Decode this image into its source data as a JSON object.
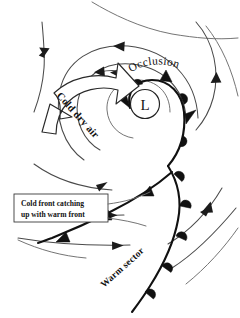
{
  "diagram": {
    "type": "weather-front-diagram",
    "background_color": "#ffffff",
    "ink_color": "#111111",
    "streamline_color": "#4a4a4a"
  },
  "labels": {
    "low_center": "L",
    "occlusion": "Occlusion",
    "cold_dry_air": "Cold dry air",
    "warm_sector": "Warm sector",
    "callout_line1": "Cold front catching",
    "callout_line2": "up with warm front"
  },
  "fronts": [
    {
      "name": "occluded-front",
      "symbol": "alternating-triangle-and-semicircle",
      "color": "#111111"
    },
    {
      "name": "cold-front",
      "symbol": "filled-triangle",
      "color": "#111111"
    },
    {
      "name": "warm-front",
      "symbol": "filled-semicircle",
      "color": "#111111"
    }
  ],
  "icons": {
    "low_pressure": "low-pressure-icon",
    "rotation_arrow": "curved-banner-arrow-icon",
    "streamline_arrow": "streamline-arrowhead-icon"
  }
}
